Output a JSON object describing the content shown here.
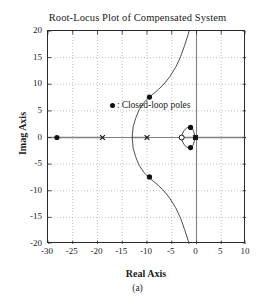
{
  "chart_data": {
    "type": "scatter",
    "title": "Root-Locus Plot of Compensated System",
    "xlabel": "Real Axis",
    "ylabel": "Imag Axis",
    "caption": "(a)",
    "xlim": [
      -30,
      10
    ],
    "ylim": [
      -20,
      20
    ],
    "xticks": [
      -30,
      -25,
      -20,
      -15,
      -10,
      -5,
      0,
      5,
      10
    ],
    "yticks": [
      20,
      15,
      10,
      5,
      0,
      -5,
      -10,
      -15,
      -20
    ],
    "xtick_labels": [
      "-30",
      "-25",
      "-20",
      "-15",
      "-10",
      "-5",
      "0",
      "5",
      "10"
    ],
    "ytick_labels": [
      "20",
      "15",
      "10",
      "5",
      "0",
      "-5",
      "-10",
      "-15",
      "-20"
    ],
    "grid": true,
    "grid_style": "dotted",
    "grid_color": "#999999",
    "axis_line_color": "#808080",
    "curve_color": "#3a3a3a",
    "marker_color": "#111111",
    "legend": {
      "position": "upper-left-inside",
      "marker": "filled-circle",
      "separator": ":",
      "label": "Closed-loop poles"
    },
    "series": [
      {
        "name": "open-loop-poles",
        "marker": "x",
        "points": [
          {
            "x": -19.0,
            "y": 0
          },
          {
            "x": -10.0,
            "y": 0
          },
          {
            "x": -0.2,
            "y": 0
          }
        ]
      },
      {
        "name": "open-loop-zeros",
        "marker": "o",
        "points": [
          {
            "x": -3.0,
            "y": 0
          }
        ]
      },
      {
        "name": "closed-loop-poles",
        "marker": "filled-circle",
        "points": [
          {
            "x": -28.2,
            "y": 0
          },
          {
            "x": -9.5,
            "y": 7.6
          },
          {
            "x": -9.5,
            "y": -7.4
          },
          {
            "x": -1.2,
            "y": 1.9
          },
          {
            "x": -1.2,
            "y": -1.9
          },
          {
            "x": -0.2,
            "y": 0
          }
        ]
      }
    ],
    "loci": [
      {
        "name": "real-axis-segment-left",
        "type": "segment",
        "points": [
          [
            -30,
            0
          ],
          [
            -19,
            0
          ]
        ]
      },
      {
        "name": "real-axis-segment-mid",
        "type": "segment",
        "points": [
          [
            -13,
            0
          ],
          [
            -10,
            0
          ]
        ]
      },
      {
        "name": "real-axis-segment-right",
        "type": "segment",
        "points": [
          [
            -3,
            0
          ],
          [
            10,
            0
          ]
        ]
      },
      {
        "name": "main-branch-upper",
        "type": "curve",
        "points": [
          [
            -13.0,
            0
          ],
          [
            -12.8,
            2.0
          ],
          [
            -12.3,
            3.6
          ],
          [
            -11.6,
            5.2
          ],
          [
            -10.6,
            6.6
          ],
          [
            -9.5,
            7.6
          ],
          [
            -8.2,
            8.6
          ],
          [
            -6.8,
            9.8
          ],
          [
            -5.4,
            11.4
          ],
          [
            -4.2,
            13.2
          ],
          [
            -3.2,
            15.2
          ],
          [
            -2.4,
            17.3
          ],
          [
            -1.7,
            19.3
          ],
          [
            -1.5,
            20.0
          ]
        ]
      },
      {
        "name": "main-branch-lower",
        "type": "curve",
        "points": [
          [
            -13.0,
            0
          ],
          [
            -12.8,
            -2.0
          ],
          [
            -12.3,
            -3.6
          ],
          [
            -11.6,
            -5.2
          ],
          [
            -10.6,
            -6.6
          ],
          [
            -9.5,
            -7.6
          ],
          [
            -8.2,
            -8.6
          ],
          [
            -6.8,
            -9.8
          ],
          [
            -5.4,
            -11.4
          ],
          [
            -4.2,
            -13.2
          ],
          [
            -3.2,
            -15.2
          ],
          [
            -2.4,
            -17.3
          ],
          [
            -1.7,
            -19.3
          ],
          [
            -1.5,
            -20.0
          ]
        ]
      },
      {
        "name": "small-loop-near-origin",
        "type": "closed-curve",
        "points": [
          [
            -0.25,
            0.1
          ],
          [
            -0.7,
            1.5
          ],
          [
            -1.2,
            1.95
          ],
          [
            -1.9,
            1.85
          ],
          [
            -2.5,
            1.35
          ],
          [
            -2.9,
            0.6
          ],
          [
            -3.0,
            0
          ],
          [
            -2.9,
            -0.6
          ],
          [
            -2.5,
            -1.35
          ],
          [
            -1.9,
            -1.85
          ],
          [
            -1.2,
            -1.95
          ],
          [
            -0.7,
            -1.5
          ],
          [
            -0.25,
            -0.1
          ]
        ]
      }
    ]
  }
}
